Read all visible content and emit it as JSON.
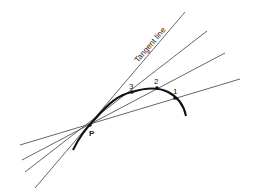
{
  "diagram": {
    "colors": {
      "line": "#555555",
      "curve": "#111111",
      "text": "#222222",
      "background": "#ffffff"
    },
    "point_p": {
      "label": "P",
      "x": 90,
      "y": 125
    },
    "tangent": {
      "label": "Tangent line",
      "x1": 35,
      "y1": 188,
      "x2": 185,
      "y2": 12
    },
    "secants": [
      {
        "label": "3",
        "x1": 25,
        "y1": 172,
        "x2": 207,
        "y2": 31,
        "px": 132,
        "py": 92,
        "lx": 129,
        "ly": 89
      },
      {
        "label": "2",
        "x1": 22,
        "y1": 160,
        "x2": 225,
        "y2": 53,
        "px": 157,
        "py": 88,
        "lx": 154,
        "ly": 84
      },
      {
        "label": "1",
        "x1": 20,
        "y1": 145,
        "x2": 240,
        "y2": 79,
        "px": 175,
        "py": 98,
        "lx": 173,
        "ly": 94
      }
    ],
    "curve_path": "M73,150 C80,135 88,126 96,118 C108,104 118,95 132,92 C148,87 160,88 168,92 C178,97 184,106 186,116"
  }
}
